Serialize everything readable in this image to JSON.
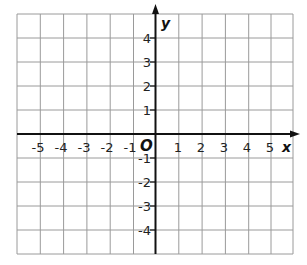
{
  "figure": {
    "type": "coordinate-plane",
    "x_axis_label": "x",
    "y_axis_label": "y",
    "origin_label": "O",
    "x_ticks": [
      "-5",
      "-4",
      "-3",
      "-2",
      "-1",
      "1",
      "2",
      "3",
      "4",
      "5"
    ],
    "y_ticks": [
      "4",
      "3",
      "2",
      "1",
      "-1",
      "-2",
      "-3",
      "-4"
    ],
    "x_range": [
      -6,
      5.9
    ],
    "y_range": [
      -5,
      5.1
    ],
    "grid": true,
    "colors": {
      "grid": "#9a9a9a",
      "axis": "#111111",
      "background": "#ffffff"
    }
  },
  "labels": {
    "x": "x",
    "y": "y",
    "o": "O",
    "xn5": "-5",
    "xn4": "-4",
    "xn3": "-3",
    "xn2": "-2",
    "xn1": "-1",
    "x1": "1",
    "x2": "2",
    "x3": "3",
    "x4": "4",
    "x5": "5",
    "y4": "4",
    "y3": "3",
    "y2": "2",
    "y1": "1",
    "yn1": "-1",
    "yn2": "-2",
    "yn3": "-3",
    "yn4": "-4"
  }
}
